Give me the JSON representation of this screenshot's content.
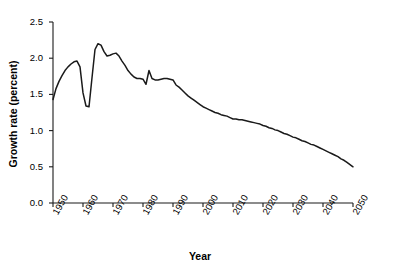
{
  "chart_data": {
    "type": "line",
    "title": "",
    "xlabel": "Year",
    "ylabel": "Growth rate (percent)",
    "xlim": [
      1950,
      2050
    ],
    "ylim": [
      0.0,
      2.5
    ],
    "grid": false,
    "legend": "none",
    "line_color": "#1a1a1a",
    "xticks": [
      1950,
      1960,
      1970,
      1980,
      1990,
      2000,
      2010,
      2020,
      2030,
      2040,
      2050
    ],
    "xtick_labels": [
      "1950",
      "1960",
      "1970",
      "1980",
      "1990",
      "2000",
      "2010",
      "2020",
      "2030",
      "2040",
      "2050"
    ],
    "yticks": [
      0.0,
      0.5,
      1.0,
      1.5,
      2.0,
      2.5
    ],
    "ytick_labels": [
      "0.0",
      "0.5",
      "1.0",
      "1.5",
      "2.0",
      "2.5"
    ],
    "x": [
      1950,
      1951,
      1952,
      1953,
      1954,
      1955,
      1956,
      1957,
      1958,
      1959,
      1960,
      1961,
      1962,
      1963,
      1964,
      1965,
      1966,
      1967,
      1968,
      1969,
      1970,
      1971,
      1972,
      1973,
      1974,
      1975,
      1976,
      1977,
      1978,
      1979,
      1980,
      1981,
      1982,
      1983,
      1984,
      1985,
      1986,
      1987,
      1988,
      1989,
      1990,
      1991,
      1992,
      1993,
      1994,
      1995,
      1996,
      1997,
      1998,
      1999,
      2000,
      2001,
      2002,
      2003,
      2004,
      2005,
      2006,
      2007,
      2008,
      2009,
      2010,
      2011,
      2012,
      2013,
      2014,
      2015,
      2016,
      2017,
      2018,
      2019,
      2020,
      2021,
      2022,
      2023,
      2024,
      2025,
      2026,
      2027,
      2028,
      2029,
      2030,
      2031,
      2032,
      2033,
      2034,
      2035,
      2036,
      2037,
      2038,
      2039,
      2040,
      2041,
      2042,
      2043,
      2044,
      2045,
      2046,
      2047,
      2048,
      2049,
      2050
    ],
    "y": [
      1.43,
      1.58,
      1.68,
      1.76,
      1.83,
      1.88,
      1.92,
      1.95,
      1.96,
      1.88,
      1.52,
      1.34,
      1.33,
      1.73,
      2.12,
      2.2,
      2.18,
      2.09,
      2.03,
      2.04,
      2.06,
      2.07,
      2.03,
      1.96,
      1.9,
      1.83,
      1.78,
      1.74,
      1.72,
      1.72,
      1.71,
      1.64,
      1.83,
      1.72,
      1.7,
      1.7,
      1.71,
      1.72,
      1.72,
      1.71,
      1.7,
      1.63,
      1.6,
      1.56,
      1.52,
      1.48,
      1.45,
      1.42,
      1.39,
      1.36,
      1.33,
      1.31,
      1.29,
      1.27,
      1.25,
      1.24,
      1.22,
      1.21,
      1.2,
      1.18,
      1.16,
      1.16,
      1.15,
      1.15,
      1.14,
      1.13,
      1.12,
      1.11,
      1.1,
      1.09,
      1.07,
      1.06,
      1.04,
      1.03,
      1.01,
      1.0,
      0.98,
      0.96,
      0.95,
      0.93,
      0.91,
      0.9,
      0.88,
      0.86,
      0.85,
      0.83,
      0.81,
      0.8,
      0.78,
      0.76,
      0.74,
      0.72,
      0.7,
      0.68,
      0.66,
      0.64,
      0.61,
      0.59,
      0.56,
      0.53,
      0.5
    ],
    "annotations": [
      {
        "label": "peak",
        "x": 1965,
        "y": 2.2
      },
      {
        "label": "trough-1962",
        "x": 1962,
        "y": 1.33
      },
      {
        "label": "spike-1982",
        "x": 1982,
        "y": 1.83
      },
      {
        "label": "end",
        "x": 2050,
        "y": 0.5
      }
    ]
  }
}
